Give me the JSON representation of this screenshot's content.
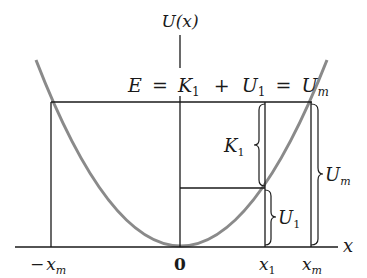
{
  "diagram": {
    "y_axis_label": "U(x)",
    "x_axis_label": "x",
    "equation": {
      "E": "E",
      "eq1": "=",
      "K": "K",
      "K_sub": "1",
      "plus": "+",
      "U": "U",
      "U_sub": "1",
      "eq2": "=",
      "Um": "U",
      "Um_sub": "m"
    },
    "brace_labels": {
      "K1": {
        "base": "K",
        "sub": "1"
      },
      "U1": {
        "base": "U",
        "sub": "1"
      },
      "Um": {
        "base": "U",
        "sub": "m"
      }
    },
    "x_ticks": {
      "neg_xm": {
        "prefix": "−",
        "base": "x",
        "sub": "m"
      },
      "zero": "0",
      "x1": {
        "base": "x",
        "sub": "1"
      },
      "xm": {
        "base": "x",
        "sub": "m"
      }
    },
    "colors": {
      "curve": "#8a8a8a",
      "lines": "#1a1a1a",
      "background": "#ffffff"
    }
  }
}
